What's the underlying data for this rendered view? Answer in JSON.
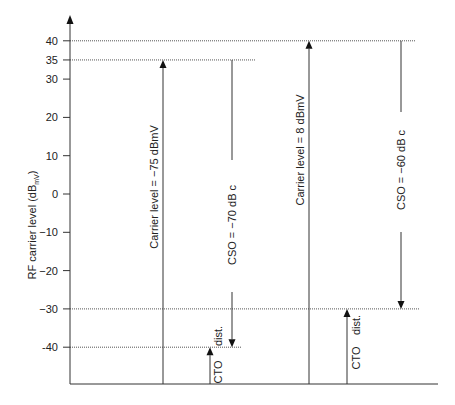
{
  "chart_data": {
    "type": "diagram",
    "title": "",
    "ylabel": "RF carrier level (dB",
    "ylabel_subscript": "mV",
    "ylabel_suffix": ")",
    "ylim": [
      -52,
      47
    ],
    "yticks": [
      40,
      35,
      30,
      20,
      10,
      0,
      -10,
      -20,
      -30,
      -40
    ],
    "ytick_labels": [
      "40",
      "35",
      "30",
      "20",
      "10",
      "0",
      "−10",
      "−20",
      "−30",
      "-40"
    ],
    "reference_levels": [
      {
        "name": "level-40",
        "value": 40
      },
      {
        "name": "level-35",
        "value": 35
      },
      {
        "name": "level-minus-30",
        "value": -30
      },
      {
        "name": "level-minus-40",
        "value": -40
      }
    ],
    "scenarios": [
      {
        "carrier": {
          "from": -52,
          "to": 35,
          "label": "Carrier  level = −75 dBmV"
        },
        "cso": {
          "from": 35,
          "to": -40,
          "label": "CSO = −70 dB c"
        },
        "cto": {
          "from": -52,
          "to": -40,
          "label_main": "CTO",
          "label_extra": "dist."
        }
      },
      {
        "carrier": {
          "from": -52,
          "to": 40,
          "label": "Carrier  level = 8 dBmV"
        },
        "cso": {
          "from": 40,
          "to": -30,
          "label": "CSO = −60 dB c"
        },
        "cto": {
          "from": -52,
          "to": -30,
          "label_main": "CTO",
          "label_extra": "dist."
        }
      }
    ]
  }
}
